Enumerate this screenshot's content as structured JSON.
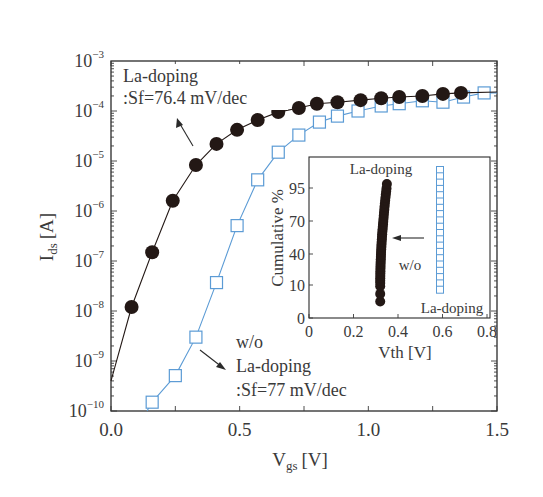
{
  "chart_data": {
    "type": "scatter",
    "title": "",
    "xlabel": "V_gs [V]",
    "xlabel_main": "V",
    "xlabel_sub": "gs",
    "xlabel_unit": "[V]",
    "ylabel": "I_ds [A]",
    "ylabel_main": "I",
    "ylabel_sub": "ds",
    "ylabel_unit": "[A]",
    "xlim": [
      0.0,
      1.5
    ],
    "ylim": [
      1e-10,
      0.001
    ],
    "yscale": "log",
    "grid": false,
    "x_ticks": [
      "0.0",
      "0.5",
      "1.0",
      "1.5"
    ],
    "x_tick_values": [
      0.0,
      0.5,
      1.0,
      1.5
    ],
    "y_ticks": [
      {
        "base": "10",
        "exp": "−3",
        "value": -3
      },
      {
        "base": "10",
        "exp": "−4",
        "value": -4
      },
      {
        "base": "10",
        "exp": "−5",
        "value": -5
      },
      {
        "base": "10",
        "exp": "−6",
        "value": -6
      },
      {
        "base": "10",
        "exp": "−7",
        "value": -7
      },
      {
        "base": "10",
        "exp": "−8",
        "value": -8
      },
      {
        "base": "10",
        "exp": "−9",
        "value": -9
      },
      {
        "base": "10",
        "exp": "−10",
        "value": -10
      }
    ],
    "series": [
      {
        "name": "La-doping",
        "marker": "filled-circle",
        "color": "#231815",
        "line_color": "#231815",
        "x": [
          0.08,
          0.16,
          0.24,
          0.33,
          0.41,
          0.49,
          0.57,
          0.65,
          0.73,
          0.8,
          0.88,
          0.97,
          1.05,
          1.12,
          1.21,
          1.29,
          1.36
        ],
        "y": [
          1.2e-08,
          1.5e-07,
          1.6e-06,
          8.3e-06,
          2.2e-05,
          4.2e-05,
          6.6e-05,
          9.5e-05,
          0.000115,
          0.00014,
          0.00015,
          0.000165,
          0.00018,
          0.00019,
          0.0002,
          0.00022,
          0.00023
        ]
      },
      {
        "name": "w/o La-doping",
        "marker": "open-square",
        "color": "#5b9bd5",
        "line_color": "#5b9bd5",
        "x": [
          0.16,
          0.25,
          0.33,
          0.41,
          0.49,
          0.57,
          0.65,
          0.73,
          0.81,
          0.88,
          0.96,
          1.05,
          1.12,
          1.21,
          1.29,
          1.37,
          1.45
        ],
        "y": [
          1.5e-10,
          5.1e-10,
          3e-09,
          3.7e-08,
          5.1e-07,
          4.2e-06,
          1.5e-05,
          3.3e-05,
          6e-05,
          7.9e-05,
          0.0001,
          0.000126,
          0.00014,
          0.00016,
          0.00015,
          0.00019,
          0.00023
        ]
      }
    ],
    "annotations": [
      {
        "lines": [
          "La-doping",
          ":Sf=76.4 mV/dec"
        ]
      },
      {
        "lines": [
          "w/o",
          "La-doping",
          ":Sf=77 mV/dec"
        ]
      }
    ],
    "inset": {
      "type": "scatter",
      "xlabel": "Vth [V]",
      "ylabel": "Cumulative %",
      "xlim": [
        0,
        0.8
      ],
      "x_ticks": [
        "0",
        "0.2",
        "0.4",
        "0.6",
        "0.8"
      ],
      "x_tick_values": [
        0,
        0.2,
        0.4,
        0.6,
        0.8
      ],
      "y_ticks": [
        "0",
        "10",
        "40",
        "70",
        "95"
      ],
      "yscale": "probability",
      "label_top": "La-doping",
      "label_mid": "w/o",
      "label_bottom": "La-doping",
      "series": [
        {
          "name": "La-doping",
          "marker": "filled-circle",
          "color": "#231815",
          "vth_range": [
            0.32,
            0.35
          ],
          "cumulative_range": [
            5,
            97
          ]
        },
        {
          "name": "w/o La-doping",
          "marker": "open-square",
          "color": "#5b9bd5",
          "vth_range": [
            0.63,
            0.63
          ],
          "cumulative_range": [
            5,
            97
          ]
        }
      ]
    }
  }
}
